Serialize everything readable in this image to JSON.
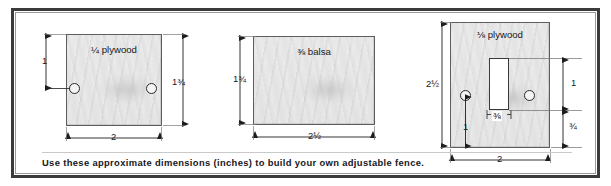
{
  "figure": {
    "caption": "Use these approximate dimensions (inches) to build your own adjustable fence.",
    "units": "inches",
    "panel_count": 3
  },
  "panels": [
    {
      "id": "panel-plywood-quarter",
      "material_label": "¼ plywood",
      "width_label": "2",
      "height_label": "1¾",
      "hole_offset_label": "1",
      "hole_count": 2
    },
    {
      "id": "panel-balsa",
      "material_label": "⅜ balsa",
      "width_label": "2½",
      "height_label": "1¾",
      "hole_count": 0
    },
    {
      "id": "panel-plywood-eighth",
      "material_label": "⅛ plywood",
      "width_label": "2",
      "height_label": "2½",
      "slot_width_label": "⅜",
      "slot_height_label": "1",
      "bottom_gap_label": "¾",
      "hole_offset_label": "1",
      "hole_count": 2
    }
  ],
  "colors": {
    "frame": "#3b3b3b",
    "inner_frame": "#9a9a9a",
    "board_fill": "#ebebeb",
    "board_stroke": "#5d5d5d",
    "ink": "#17171a",
    "slot_fill": "#ffffff"
  }
}
